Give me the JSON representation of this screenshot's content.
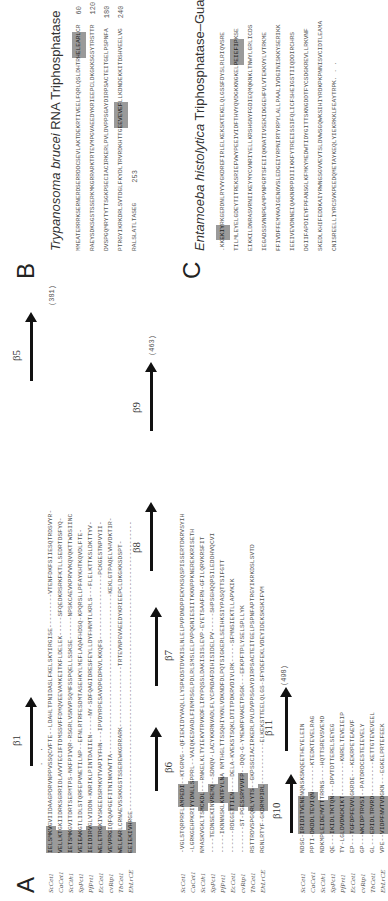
{
  "panels": {
    "A": {
      "letter": "A",
      "species": [
        "ScCet1",
        "CaCet1",
        "ScCth1",
        "SpPct1",
        "PfPrt1",
        "EcCet1",
        "cvRtp1",
        "TbCet1",
        "EhLrCE"
      ],
      "block1": {
        "beta_left": "β1",
        "beta_right": "β5",
        "count": "(381)",
        "rows": [
          {
            "hl": "IELSMKV",
            "rest": "GVIIDAAGPDRVNPPVSSQCVFTE--LDAHLTPNIDASLFKELSKYIRGISE---------VTENFDKFSIIESQTRDSVYR-"
          },
          {
            "hl": "VELLKT",
            "rest": "GKIIDRKSGRRIDLAVVTECIFTDMSSVFFDMQVEEVAMKEITKFLDELEK-----SFQEDKRSRKFKTLLSEDRTDSFYQ-"
          },
          {
            "hl": "IETSMK",
            "rest": "GVITDRTSERMTPS-NKFPIVQR-RSGRLVSNVPSQMFSSPQELLSSKSE------NPSKCAEVKPRVVKQVQKTTWDSIINC"
          },
          {
            "hl": "VEIEAK",
            "rest": "GTLIDLSTQRFEPVNETILNP--EFNLRTRFESDMTASEHKYLMEFLAQAFHDSQ-KPQRSLLPFAYKHTKQVDLFTE-"
          },
          {
            "hl": "IEIDIRV",
            "rest": "GLVIDDN-KNRIKLPINTDAIIEN-----NY-SDFQAGIDRESFEYLLDYFHNMTLKRLS---FLELKTTKSLDKTTYV-"
          },
          {
            "hl": "WELETRG",
            "rest": "KIVSKEEDSRMKVTVAPIYFHN---IPVDYRPESAVDPGDPKVLKKQFS-----------------PCKGESTNPVYII-"
          },
          {
            "hl": "VEVPRG",
            "rest": "IQFQAPGEFITNINKVWTTA------------------------------------------KEKLGTPAQELVHVDKTIR-"
          },
          {
            "hl": "WELEAR",
            "rest": "LCRNAEVSSKKGSTSSEREWKGRRARK----------------TRTEVNPGVAEEDYKRIEEPCLDKGKKSDSPT-"
          },
          {
            "hl": "EEIEKIVH",
            "rest": "RGE----------------------------------------------------------------------------"
          }
        ]
      },
      "block2": {
        "betas": [
          "β6",
          "β7",
          "β8",
          "β9"
        ],
        "count": "(463)",
        "rows": [
          {
            "pre": "-VGLSTQRPRFL",
            "hl": "AMPEDI",
            "rest": "--KTGRVG--QFIEKIDYVAQLLLYSPKDSTDVKISLNLELPVPDNDPPEKYKSQSPISSERTDKRVSYIH"
          },
          {
            "pre": "-LGRKGEHPKRI",
            "hl": "YYDNLLS",
            "rest": "PPRL--VAIQKESVADLFINMPSGLPDLRLSMSLELPVPQGNIESIITKKNPPKNEREKKRISETH"
          },
          {
            "pre": "NMASKVGKLTS",
            "hl": "MCKDL",
            "rest": "---RNKELKLTYIEKVTRVKDFLIRYPQSSLDAKISISLEVP-EYETSAAFRN-GFILQRVKRSFIT"
          },
          {
            "pre": "----TEDNSEKIN",
            "hl": "VREMQ",
            "rest": "--SDNQV-LACYKKRNVADLFLYCPNDAFDIHISIDELPV-----SHPSGHQQPSILEDDHVQCVI"
          },
          {
            "pre": "-----IKNNNSKL",
            "hl": "KNTFYLN",
            "rest": "A NMTHGLTTSSQHIYKNLVDKNDFDLPQTSIGKERLSEIHKSIYPASQTTSIFGTT"
          },
          {
            "pre": "------RDEGE",
            "hl": "TTIEN",
            "rest": "----DELA-KVEKSTSQKLDTITPDKRVDIVLRK-----SFMNSIEKTLLAPVKIK"
          },
          {
            "pre": "-------ST-PG",
            "hl": "ESSRYVVFP",
            "rest": "--DQQ-G-YMEWRFVAKETPSGK---EFKPFTPLYSELSPLLYK"
          },
          {
            "pre": "RSTTRDVSPGQ",
            "hl": "RLYYTS",
            "rest": "--GKPSSCIACIRKERLPVLDVPPSGAYDIRPSACTEITGELPSPNFAPTRGYIKRKDSLSVTD"
          },
          {
            "pre": "RGNLRTYF-GK",
            "hl": "DRMPIRL",
            "rest": "-----------ELKEKSTTEELQLGS-SFYDEFEKLVDEYIDEKSKSKIFVM"
          }
        ]
      },
      "block3": {
        "betas": [
          "β10",
          "β11"
        ],
        "count": "(498)",
        "rows": [
          {
            "pre": "NDSC-",
            "hl": "IRIDITVENE",
            "rest": "NQNSKSNQEETHEYELEIN"
          },
          {
            "pre": "PPTI-",
            "hl": "DKDDLTEVIQN",
            "rest": "-------KTEDKTEVELRAG"
          },
          {
            "pre": "NDKMP",
            "hl": "LEIDEMVTT",
            "rest": "TRRNS----HQTTSREVSVEMD"
          },
          {
            "pre": "QE---",
            "hl": "IKIDLTKTQN",
            "rest": "---DPVTDTTERELSEYEG"
          },
          {
            "pre": "TY-LG",
            "hl": "LDVDNCKIKT",
            "rest": "---------KNRELTEVEIEIP"
          },
          {
            "pre": "EP---",
            "hl": "TGFDPFEVVL",
            "rest": "GKRDE---KEKRPETEAEVF"
          },
          {
            "pre": "GP---",
            "hl": "WKIDPTRVSI",
            "rest": "--PATDRDCESTEIEVELY"
          },
          {
            "pre": "GL---",
            "hl": "ERIDLTRVRD",
            "rest": "---------KETTGTEVEVEEL"
          },
          {
            "pre": "VPE--",
            "hl": "VIDPFNVTVD",
            "rest": "GKN---EGKELPRTEFEEK"
          }
        ]
      }
    },
    "B": {
      "letter": "B",
      "title_italic": "Trypanosoma brucei",
      "title_plain": " RNA Triphosphatase",
      "lines": [
        {
          "seq": "MMEATERRRKSERNERDSERRDDCSEVLAKTDEKRTIVEELFQRLQSLDHTR",
          "hl": "HELEARL",
          "tail": "CR",
          "num": "60"
        },
        {
          "seq": "RAEYSDKSGSTSSERKMKGRRARKTRTEVMPGVAEEDYKRIEEPCLDKGKKSGSYTRSTTR",
          "hl": "",
          "tail": "",
          "num": "120"
        },
        {
          "seq": "DVSPGQMRYTYTTSGKPSECIACIRKERLPVLDVPPSGAYDIRPSACTEITGELPSPNFA",
          "hl": "",
          "tail": "",
          "num": "180"
        },
        {
          "seq": "PTRGYIKRKDRLSVTDGLFKYDLTRVRDKHTTG",
          "hl": "EEVEVEF",
          "tail": "LLKDNDEKKITDSHVEELVG",
          "num": "240"
        },
        {
          "seq": "RALSLATLTASEG",
          "hl": "",
          "tail": "",
          "num": "253",
          "num_inline": true
        }
      ]
    },
    "C": {
      "letter": "C",
      "title_italic": "Entamoeba histolytica",
      "title_plain": " Triphosphatase–Guanylyltransferase",
      "lines": [
        {
          "pre": ".KK",
          "hl": "EKIY",
          "seq": "RKGERDNLRYVYGKDREFIRLELKEKSKTEKELQLGSSFDYSLRLRIQVSRE"
        },
        {
          "pre": "",
          "hl": "",
          "seq": "TILMLEYELGDEYTITREKSRIEFVWYPEEIVIDFTHVYQVDGKKNGKEL",
          "hl2": "PEIEFIP",
          "tail": "KSE"
        },
        {
          "pre": "",
          "hl": "",
          "seq": "EIKKILDNRASVRNIIKEYMYCVNRIYELLKRSHGNYFGDIEQMQKNKLTNWYLGRLICDS"
        },
        {
          "pre": "",
          "hl": "",
          "seq": "IEGADSSVNNPGAMPVNPGRTSFEIIQKNATIVSEKIDGGEHFVLVTEKKVYLVTRKME"
        },
        {
          "pre": "",
          "hl": "",
          "seq": "FFIVDFFEMVKAIGENOVSLEDGEIYRPNIRTYRPYLALLPAALIVDGINISKKYSERIKK"
        },
        {
          "pre": "",
          "hl": "",
          "seq": "IEEIVEVDNNEIQAKNRPPDIIIKKFYTREEISSIFQLICFSHEIGSTIIQDDIRCHRS"
        },
        {
          "pre": "",
          "hl": "",
          "seq": "DGIIFAPDIEYFPFANSGLKFMKYMEDWTIDYGITTSKNGDDTFYCSDGKREVLLRKVNF"
        },
        {
          "pre": "",
          "hl": "",
          "seq": "SKEDLKHIFEDDKAIYRWNGSGVVEVTSLDVWSGQWKSIHIYRDKPKPNNISVCIDTLEAMA"
        },
        {
          "pre": "",
          "hl": "",
          "seq": "CNISREELLIYRCSVKPEEDQMETAYKEQLYIEKRKKLFEAYTRPK. . ."
        }
      ]
    }
  }
}
